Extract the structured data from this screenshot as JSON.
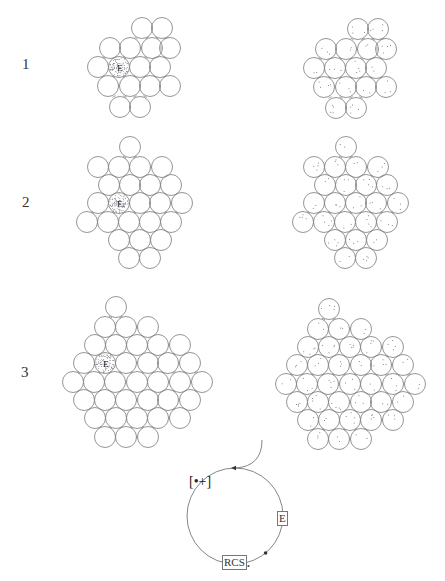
{
  "figure": {
    "row_labels": [
      {
        "text": "1",
        "x": 22,
        "y": 56
      },
      {
        "text": "2",
        "x": 22,
        "y": 194
      },
      {
        "text": "3",
        "x": 21,
        "y": 364
      }
    ],
    "circle_radius": 10.5,
    "stroke_color": "#8a8a8a",
    "stipple_color": "#555555",
    "panels": [
      {
        "id": "left-1",
        "style": "hollow",
        "highlight": {
          "x": 119,
          "y": 67,
          "label": "E"
        },
        "circles": [
          [
            142,
            28
          ],
          [
            162,
            28
          ],
          [
            110,
            48
          ],
          [
            130,
            48
          ],
          [
            152,
            48
          ],
          [
            170,
            48
          ],
          [
            98,
            67
          ],
          [
            119,
            67
          ],
          [
            140,
            67
          ],
          [
            160,
            67
          ],
          [
            108,
            86
          ],
          [
            130,
            86
          ],
          [
            150,
            86
          ],
          [
            170,
            86
          ],
          [
            120,
            107
          ],
          [
            140,
            107
          ]
        ]
      },
      {
        "id": "right-1",
        "style": "dotted",
        "offset": [
          216,
          1
        ],
        "copy_of": "left-1"
      },
      {
        "id": "left-2",
        "style": "hollow",
        "highlight": {
          "x": 119,
          "y": 203,
          "label": "E"
        },
        "circles": [
          [
            130,
            147
          ],
          [
            98,
            167
          ],
          [
            119,
            167
          ],
          [
            140,
            167
          ],
          [
            162,
            167
          ],
          [
            109,
            185
          ],
          [
            130,
            185
          ],
          [
            150,
            185
          ],
          [
            171,
            185
          ],
          [
            98,
            203
          ],
          [
            119,
            203
          ],
          [
            140,
            203
          ],
          [
            160,
            203
          ],
          [
            182,
            203
          ],
          [
            87,
            222
          ],
          [
            108,
            222
          ],
          [
            129,
            222
          ],
          [
            150,
            222
          ],
          [
            171,
            222
          ],
          [
            119,
            240
          ],
          [
            140,
            240
          ],
          [
            161,
            240
          ],
          [
            129,
            258
          ],
          [
            150,
            258
          ]
        ]
      },
      {
        "id": "right-2",
        "style": "dotted",
        "offset": [
          216,
          0
        ],
        "copy_of": "left-2"
      },
      {
        "id": "left-3",
        "style": "hollow",
        "highlight": {
          "x": 105,
          "y": 363,
          "label": "E"
        },
        "circles": [
          [
            116,
            307
          ],
          [
            105,
            327
          ],
          [
            126,
            327
          ],
          [
            148,
            327
          ],
          [
            95,
            345
          ],
          [
            116,
            345
          ],
          [
            137,
            345
          ],
          [
            158,
            345
          ],
          [
            180,
            345
          ],
          [
            84,
            363
          ],
          [
            105,
            363
          ],
          [
            126,
            363
          ],
          [
            148,
            363
          ],
          [
            168,
            363
          ],
          [
            190,
            363
          ],
          [
            73,
            382
          ],
          [
            94,
            382
          ],
          [
            115,
            382
          ],
          [
            137,
            382
          ],
          [
            158,
            382
          ],
          [
            180,
            382
          ],
          [
            202,
            382
          ],
          [
            84,
            400
          ],
          [
            105,
            400
          ],
          [
            126,
            400
          ],
          [
            148,
            400
          ],
          [
            168,
            400
          ],
          [
            190,
            400
          ],
          [
            95,
            418
          ],
          [
            116,
            418
          ],
          [
            137,
            418
          ],
          [
            158,
            418
          ],
          [
            180,
            418
          ],
          [
            105,
            437
          ],
          [
            126,
            437
          ],
          [
            148,
            437
          ]
        ]
      },
      {
        "id": "right-3",
        "style": "dotted",
        "offset": [
          213,
          2
        ],
        "copy_of": "left-3"
      }
    ],
    "cycle": {
      "center": [
        235,
        516
      ],
      "radius": 48,
      "entry_curve": {
        "from": [
          262,
          440
        ],
        "to": [
          236,
          468
        ]
      },
      "labels": {
        "radical": "[•+]",
        "enzyme": "E",
        "product": "RCS",
        "product_sub": "•"
      },
      "positions": {
        "radical": [
          189,
          474
        ],
        "enzyme": [
          277,
          511
        ],
        "product": [
          222,
          555
        ],
        "product_sub": [
          247,
          562
        ]
      }
    }
  }
}
